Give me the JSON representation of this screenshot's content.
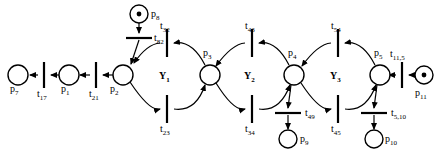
{
  "diagram": {
    "type": "petri-net",
    "title": "",
    "places": [
      {
        "id": "p7",
        "label": "p",
        "sub": "7",
        "cx": 18,
        "cy": 75,
        "r": 10,
        "tokens": 0,
        "label_x": 10,
        "label_y": 88
      },
      {
        "id": "p1",
        "label": "p",
        "sub": "1",
        "cx": 69,
        "cy": 75,
        "r": 10,
        "tokens": 0,
        "label_x": 61,
        "label_y": 88
      },
      {
        "id": "p2",
        "label": "p",
        "sub": "2",
        "cx": 123,
        "cy": 75,
        "r": 10,
        "tokens": 0,
        "label_x": 111,
        "label_y": 88
      },
      {
        "id": "p3",
        "label": "p",
        "sub": "3",
        "cx": 210,
        "cy": 75,
        "r": 10,
        "tokens": 0,
        "label_x": 203,
        "label_y": 54
      },
      {
        "id": "p4",
        "label": "p",
        "sub": "4",
        "cx": 294,
        "cy": 75,
        "r": 10,
        "tokens": 0,
        "label_x": 288,
        "label_y": 54
      },
      {
        "id": "p5",
        "label": "p",
        "sub": "5",
        "cx": 380,
        "cy": 75,
        "r": 10,
        "tokens": 0,
        "label_x": 374,
        "label_y": 54
      },
      {
        "id": "p8",
        "label": "p",
        "sub": "8",
        "cx": 139,
        "cy": 14,
        "r": 9,
        "tokens": 1,
        "label_x": 151,
        "label_y": 16
      },
      {
        "id": "p9",
        "label": "p",
        "sub": "9",
        "cx": 288,
        "cy": 139,
        "r": 9,
        "tokens": 0,
        "label_x": 301,
        "label_y": 142
      },
      {
        "id": "p10",
        "label": "p",
        "sub": "10",
        "cx": 374,
        "cy": 139,
        "r": 9,
        "tokens": 0,
        "label_x": 386,
        "label_y": 142
      },
      {
        "id": "p11",
        "label": "p",
        "sub": "11",
        "cx": 424,
        "cy": 75,
        "r": 9,
        "tokens": 1,
        "label_x": 416,
        "label_y": 94
      }
    ],
    "transitions": [
      {
        "id": "t17",
        "label": "t",
        "sub": "17",
        "cx": 44,
        "cy": 75,
        "orient": "vertical",
        "len": 26,
        "label_x": 37,
        "label_y": 89
      },
      {
        "id": "t21",
        "label": "t",
        "sub": "21",
        "cx": 96,
        "cy": 75,
        "orient": "vertical",
        "len": 26,
        "label_x": 89,
        "label_y": 89
      },
      {
        "id": "t82",
        "label": "t",
        "sub": "82",
        "cx": 139,
        "cy": 38,
        "orient": "horizontal",
        "len": 26,
        "label_x": 146,
        "label_y": 35
      },
      {
        "id": "t32",
        "label": "t",
        "sub": "32",
        "cx": 167,
        "cy": 43,
        "orient": "vertical",
        "len": 28,
        "label_x": 159,
        "label_y": 27
      },
      {
        "id": "t23",
        "label": "t",
        "sub": "23",
        "cx": 167,
        "cy": 109,
        "orient": "vertical",
        "len": 28,
        "label_x": 159,
        "label_y": 127
      },
      {
        "id": "t43",
        "label": "t",
        "sub": "43",
        "cx": 252,
        "cy": 43,
        "orient": "vertical",
        "len": 28,
        "label_x": 244,
        "label_y": 27
      },
      {
        "id": "t34",
        "label": "t",
        "sub": "34",
        "cx": 252,
        "cy": 109,
        "orient": "vertical",
        "len": 28,
        "label_x": 244,
        "label_y": 127
      },
      {
        "id": "t54",
        "label": "t",
        "sub": "54",
        "cx": 338,
        "cy": 43,
        "orient": "vertical",
        "len": 28,
        "label_x": 330,
        "label_y": 27
      },
      {
        "id": "t45",
        "label": "t",
        "sub": "45",
        "cx": 338,
        "cy": 109,
        "orient": "vertical",
        "len": 28,
        "label_x": 330,
        "label_y": 127
      },
      {
        "id": "t49",
        "label": "t",
        "sub": "49",
        "cx": 288,
        "cy": 113,
        "orient": "horizontal",
        "len": 26,
        "label_x": 297,
        "label_y": 110
      },
      {
        "id": "t510",
        "label": "t",
        "sub": "5,10",
        "cx": 374,
        "cy": 113,
        "orient": "horizontal",
        "len": 26,
        "label_x": 383,
        "label_y": 110
      },
      {
        "id": "t115",
        "label": "t",
        "sub": "11,5",
        "cx": 402,
        "cy": 75,
        "orient": "vertical",
        "len": 26,
        "label_x": 392,
        "label_y": 55
      }
    ],
    "subnets": [
      {
        "id": "Y1",
        "label": "Y",
        "sub": "1",
        "x": 159,
        "y": 71
      },
      {
        "id": "Y2",
        "label": "Y",
        "sub": "2",
        "x": 244,
        "y": 71
      },
      {
        "id": "Y3",
        "label": "Y",
        "sub": "3",
        "x": 330,
        "y": 71
      }
    ],
    "colors": {
      "stroke": "#000000",
      "fill": "#ffffff",
      "text": "#000000"
    }
  }
}
